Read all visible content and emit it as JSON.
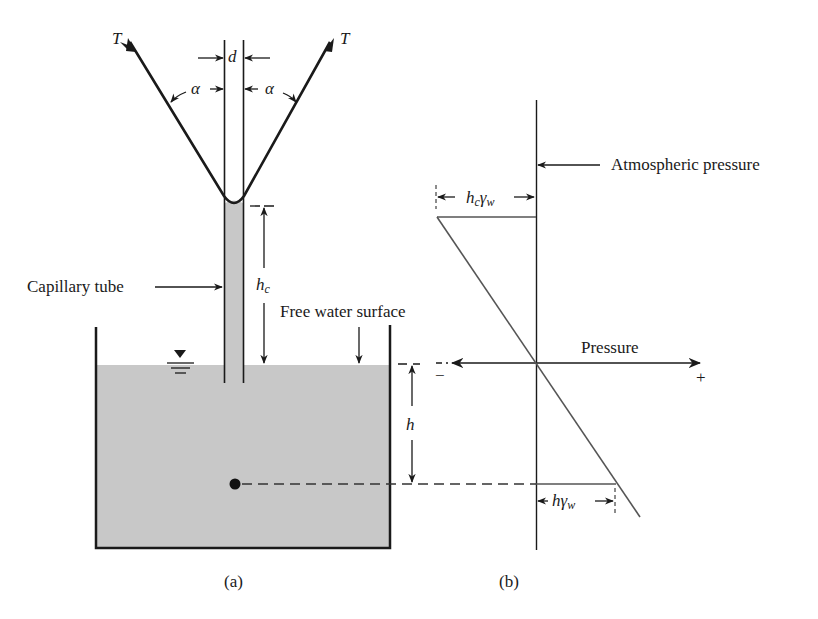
{
  "figure": {
    "panel_a": {
      "caption": "(a)",
      "tension_label_left": "T",
      "tension_label_right": "T",
      "diameter_label": "d",
      "angle_label_left": "α",
      "angle_label_right": "α",
      "capillary_rise_label": "h",
      "capillary_rise_sub": "c",
      "capillary_tube_label": "Capillary tube",
      "free_surface_label": "Free water surface",
      "depth_label": "h"
    },
    "panel_b": {
      "caption": "(b)",
      "atmospheric_label": "Atmospheric pressure",
      "pressure_axis_label": "Pressure",
      "minus_sign": "−",
      "plus_sign": "+",
      "top_dim_h": "h",
      "top_dim_c": "c",
      "top_dim_gamma": "γ",
      "top_dim_w": "w",
      "bottom_dim_h": "h",
      "bottom_dim_gamma": "γ",
      "bottom_dim_w": "w"
    },
    "colors": {
      "water": "#c8c8c8",
      "line": "#1a1a1a",
      "diagram_line": "#555555"
    }
  }
}
